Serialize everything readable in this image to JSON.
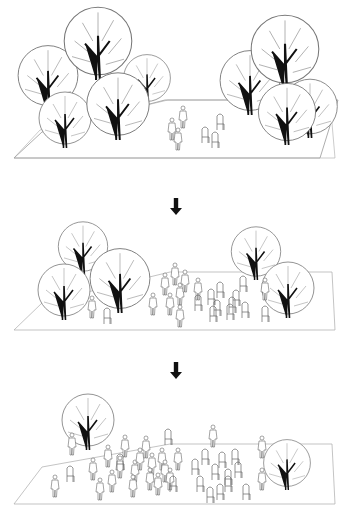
{
  "diagram": {
    "colors": {
      "line": "#555555",
      "trunk": "#111111",
      "arrow": "#111111",
      "background": "#ffffff"
    },
    "stages": [
      {
        "id": 1,
        "trees": 9,
        "people": 3,
        "chairs": 3
      },
      {
        "id": 2,
        "trees": 5,
        "people": 10,
        "chairs": 12
      },
      {
        "id": 3,
        "trees": 2,
        "people": 22,
        "chairs": 16
      }
    ],
    "arrows": [
      {
        "from": 1,
        "to": 2,
        "icon": "arrow-down-icon"
      },
      {
        "from": 2,
        "to": 3,
        "icon": "arrow-down-icon"
      }
    ]
  }
}
